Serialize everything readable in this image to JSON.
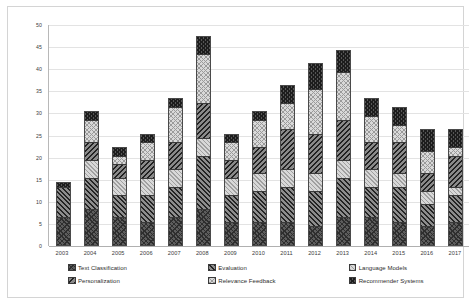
{
  "chart_data": {
    "type": "bar",
    "subtype": "stacked-column",
    "title": "",
    "xlabel": "",
    "ylabel": "",
    "ylim": [
      0,
      50
    ],
    "ytick_step": 5,
    "ytick_labels": [
      "0",
      "5",
      "10",
      "15",
      "20",
      "25",
      "30",
      "35",
      "40",
      "45",
      "50"
    ],
    "grid": true,
    "legend_position": "bottom",
    "categories": [
      "2003",
      "2004",
      "2005",
      "2006",
      "2007",
      "2008",
      "2009",
      "2010",
      "2011",
      "2012",
      "2013",
      "2014",
      "2015",
      "2016",
      "2017"
    ],
    "series": [
      {
        "name": "Text Classification",
        "pattern": "dark-crosshatch-dense",
        "values": [
          6,
          8,
          6,
          5,
          6,
          8,
          5,
          5,
          5,
          4,
          6,
          6,
          5,
          4,
          5
        ]
      },
      {
        "name": "Evaluation",
        "pattern": "dark-forward-diagonal",
        "values": [
          7,
          7,
          5,
          6,
          7,
          12,
          6,
          7,
          8,
          8,
          9,
          7,
          8,
          5,
          6
        ]
      },
      {
        "name": "Language Models",
        "pattern": "light-fine-diagonal",
        "values": [
          0,
          4,
          4,
          4,
          4,
          4,
          4,
          4,
          4,
          4,
          4,
          4,
          3,
          3,
          2
        ]
      },
      {
        "name": "Personalization",
        "pattern": "dark-back-diagonal",
        "values": [
          0,
          4,
          3,
          4,
          6,
          8,
          4,
          6,
          9,
          9,
          9,
          6,
          7,
          4,
          7
        ]
      },
      {
        "name": "Relevance Feedback",
        "pattern": "light-crosshatch",
        "values": [
          0,
          5,
          2,
          4,
          8,
          11,
          4,
          6,
          6,
          10,
          11,
          6,
          4,
          5,
          2
        ]
      },
      {
        "name": "Recommender Systems",
        "pattern": "dark-crosshatch",
        "values": [
          1,
          2,
          2,
          2,
          2,
          4,
          2,
          2,
          4,
          6,
          5,
          4,
          4,
          5,
          4
        ]
      }
    ],
    "totals": [
      14,
      30,
      22,
      25,
      33,
      47,
      25,
      30,
      36,
      41,
      44,
      33,
      31,
      26,
      26
    ]
  },
  "legend": {
    "items": [
      {
        "label": "Text Classification"
      },
      {
        "label": "Evaluation"
      },
      {
        "label": "Language Models"
      },
      {
        "label": "Personalization"
      },
      {
        "label": "Relevance Feedback"
      },
      {
        "label": "Recommender Systems"
      }
    ]
  },
  "colors": {
    "plot_background": "#ffffff",
    "frame_border": "#d4d4d4",
    "gridline": "#e3e3e3",
    "axis_line": "#b0b0b0",
    "tick_text": "#3b3b3b"
  }
}
